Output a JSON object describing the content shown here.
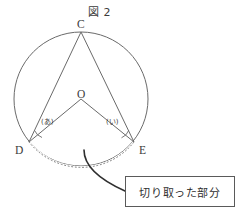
{
  "figure": {
    "title": "図 2",
    "points": {
      "center_label": "O",
      "top_label": "C",
      "left_label": "D",
      "right_label": "E"
    },
    "angles": {
      "left": "(あ)",
      "right": "(い)"
    },
    "callout": {
      "text": "切り取った部分"
    },
    "colors": {
      "stroke": "#5a5a5a",
      "text": "#3b3b3b",
      "background": "#ffffff"
    },
    "geometry": {
      "circle": {
        "cx": 81,
        "cy": 99,
        "r": 67
      },
      "point_C": {
        "x": 81,
        "y": 32
      },
      "point_D": {
        "x": 29,
        "y": 142
      },
      "point_E": {
        "x": 134,
        "y": 142
      },
      "point_O": {
        "x": 81,
        "y": 99
      }
    }
  }
}
